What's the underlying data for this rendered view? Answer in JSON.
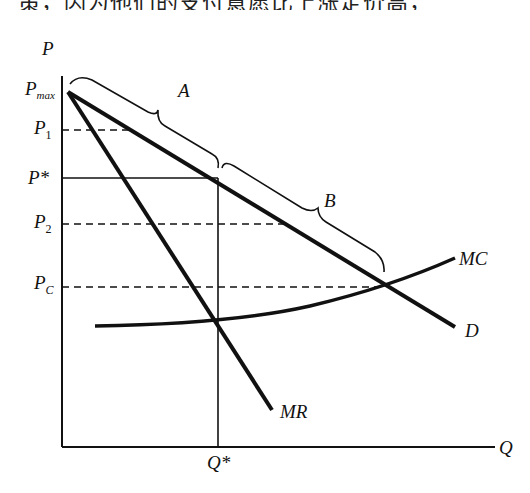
{
  "header_text": "策，因为他们的支付意愿比上涨定价高，",
  "diagram": {
    "axes": {
      "y_label": "P",
      "x_label": "Q"
    },
    "price_labels": {
      "pmax_main": "P",
      "pmax_sub": "max",
      "p1_main": "P",
      "p1_sub": "1",
      "pstar": "P*",
      "p2_main": "P",
      "p2_sub": "2",
      "pc_main": "P",
      "pc_sub": "C"
    },
    "quantity_labels": {
      "qstar": "Q*"
    },
    "curve_labels": {
      "demand": "D",
      "marginal_revenue": "MR",
      "marginal_cost": "MC"
    },
    "bracket_labels": {
      "a": "A",
      "b": "B"
    },
    "colors": {
      "ink": "#111111",
      "background": "#ffffff"
    }
  }
}
